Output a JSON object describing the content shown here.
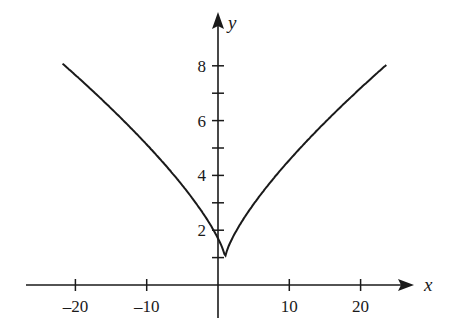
{
  "chart_data": {
    "type": "line",
    "title": "",
    "xlabel": "x",
    "ylabel": "y",
    "xlim": [
      -27,
      27
    ],
    "ylim": [
      0,
      9
    ],
    "grid": false,
    "legend": null,
    "x_ticks": [
      -20,
      -10,
      10,
      20
    ],
    "x_tick_labels": [
      "-20",
      "-10",
      "10",
      "20"
    ],
    "y_ticks": [
      1,
      2,
      3,
      4,
      5,
      6,
      7,
      8
    ],
    "y_tick_labels": [
      "",
      "2",
      "",
      "4",
      "",
      "6",
      "",
      "8"
    ],
    "series": [
      {
        "name": "curve",
        "description": "V-shaped cusp curve with minimum near (1, 1), approx y = 1 + 0.7|x-1|^0.74",
        "x": [
          -21.8,
          -18,
          -14,
          -10,
          -6,
          -3,
          -1,
          0,
          0.5,
          1,
          1.5,
          2,
          3,
          5,
          8,
          12,
          16,
          20,
          23.6
        ],
        "y": [
          8.0,
          7.0,
          5.9,
          4.9,
          3.9,
          3.0,
          2.2,
          1.7,
          1.4,
          1.0,
          1.4,
          1.7,
          2.2,
          3.0,
          3.9,
          5.3,
          6.4,
          7.3,
          8.0
        ]
      }
    ],
    "color": "#1a1a1a"
  }
}
